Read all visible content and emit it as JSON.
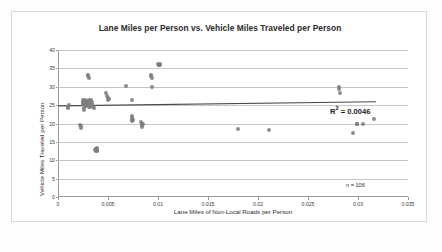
{
  "figure": {
    "background_color": "#fdfdfd",
    "frame_color": "#d8d8d8"
  },
  "annotations": {
    "r_squared_prefix": "R",
    "r_squared_exponent": "2",
    "r_squared_value": " = 0.0046",
    "sample_size": "n = 106"
  },
  "chart_data": {
    "type": "scatter",
    "title": "Lane Miles per Person vs. Vehicle Miles Traveled per Person",
    "xlabel": "Lane Miles of Non-Local Roads per Person",
    "ylabel": "Vehicle Miles Traveled per Person",
    "xlim": [
      0,
      0.035
    ],
    "ylim": [
      0,
      40
    ],
    "xticks": [
      0,
      0.005,
      0.01,
      0.015,
      0.02,
      0.025,
      0.03,
      0.035
    ],
    "xtick_labels": [
      "0",
      "0.005",
      "0.01",
      "0.015",
      "0.02",
      "0.025",
      "0.03",
      "0.035"
    ],
    "yticks": [
      0,
      5,
      10,
      15,
      20,
      25,
      30,
      35,
      40
    ],
    "ytick_labels": [
      "0",
      "5",
      "10",
      "15",
      "20",
      "25",
      "30",
      "35",
      "40"
    ],
    "grid": "horizontal",
    "legend": "none",
    "marker_color": "#7d7d7d",
    "marker_size": 4,
    "series": [
      {
        "name": "Urbanized areas",
        "points": [
          [
            0.00095,
            24.3
          ],
          [
            0.001,
            24.6
          ],
          [
            0.00105,
            24.9
          ],
          [
            0.0022,
            19.7
          ],
          [
            0.00225,
            19.2
          ],
          [
            0.0023,
            18.9
          ],
          [
            0.00245,
            26.3
          ],
          [
            0.0025,
            25.9
          ],
          [
            0.00252,
            25.4
          ],
          [
            0.00255,
            24.9
          ],
          [
            0.00258,
            24.2
          ],
          [
            0.0026,
            23.6
          ],
          [
            0.00262,
            26.1
          ],
          [
            0.00265,
            25.6
          ],
          [
            0.00268,
            25.1
          ],
          [
            0.0027,
            26.4
          ],
          [
            0.00272,
            25.8
          ],
          [
            0.00275,
            25.2
          ],
          [
            0.00278,
            24.7
          ],
          [
            0.0028,
            26.2
          ],
          [
            0.00285,
            25.5
          ],
          [
            0.0029,
            24.9
          ],
          [
            0.00295,
            26.0
          ],
          [
            0.003,
            25.3
          ],
          [
            0.00305,
            24.6
          ],
          [
            0.0031,
            26.3
          ],
          [
            0.00315,
            25.7
          ],
          [
            0.0032,
            24.4
          ],
          [
            0.0033,
            26.3
          ],
          [
            0.00335,
            25.8
          ],
          [
            0.0034,
            25.2
          ],
          [
            0.0035,
            24.6
          ],
          [
            0.00355,
            24.2
          ],
          [
            0.003,
            33.3
          ],
          [
            0.00302,
            32.9
          ],
          [
            0.00305,
            32.5
          ],
          [
            0.0037,
            12.9
          ],
          [
            0.00375,
            13.1
          ],
          [
            0.00378,
            12.7
          ],
          [
            0.0038,
            13.0
          ],
          [
            0.00382,
            12.5
          ],
          [
            0.00385,
            12.8
          ],
          [
            0.00388,
            13.2
          ],
          [
            0.0039,
            12.6
          ],
          [
            0.00392,
            12.9
          ],
          [
            0.0048,
            28.2
          ],
          [
            0.0049,
            27.5
          ],
          [
            0.00495,
            26.9
          ],
          [
            0.005,
            26.4
          ],
          [
            0.00505,
            26.7
          ],
          [
            0.0068,
            30.1
          ],
          [
            0.0074,
            26.3
          ],
          [
            0.00735,
            22.1
          ],
          [
            0.00738,
            21.6
          ],
          [
            0.0074,
            21.0
          ],
          [
            0.00742,
            20.6
          ],
          [
            0.00745,
            20.9
          ],
          [
            0.0083,
            20.3
          ],
          [
            0.00835,
            19.9
          ],
          [
            0.00838,
            19.5
          ],
          [
            0.0084,
            19.1
          ],
          [
            0.00842,
            19.7
          ],
          [
            0.00845,
            20.0
          ],
          [
            0.0093,
            33.2
          ],
          [
            0.00933,
            32.8
          ],
          [
            0.00936,
            32.4
          ],
          [
            0.0094,
            29.8
          ],
          [
            0.01,
            36.1
          ],
          [
            0.01005,
            35.9
          ],
          [
            0.0101,
            36.0
          ],
          [
            0.01015,
            35.8
          ],
          [
            0.0102,
            36.2
          ],
          [
            0.018,
            18.5
          ],
          [
            0.0211,
            18.2
          ],
          [
            0.0281,
            30.0
          ],
          [
            0.02812,
            29.4
          ],
          [
            0.02815,
            28.2
          ],
          [
            0.0295,
            17.3
          ],
          [
            0.02985,
            19.8
          ],
          [
            0.0299,
            19.9
          ],
          [
            0.0305,
            19.8
          ],
          [
            0.0316,
            21.3
          ]
        ]
      }
    ],
    "trendline": {
      "type": "linear",
      "x_start": 0.0,
      "y_start": 24.8,
      "x_end": 0.0318,
      "y_end": 25.9,
      "color": "#4a4a4a",
      "r_squared": 0.0046
    },
    "sample_size": 106
  }
}
